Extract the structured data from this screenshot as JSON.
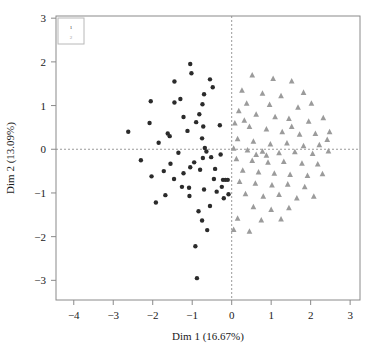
{
  "chart_data": {
    "type": "scatter",
    "title": "",
    "xlabel": "Dim 1 (16.67%)",
    "ylabel": "Dim 2 (13.09%)",
    "xlim": [
      -4.45,
      3.25
    ],
    "ylim": [
      -3.45,
      3.05
    ],
    "xticks": [
      -4,
      -3,
      -2,
      -1,
      0,
      1,
      2,
      3
    ],
    "xticklabels": [
      "−4",
      "−3",
      "−2",
      "−1",
      "0",
      "1",
      "2",
      "3"
    ],
    "yticks": [
      -3,
      -2,
      -1,
      0,
      1,
      2,
      3
    ],
    "yticklabels": [
      "−3",
      "−2",
      "−1",
      "0",
      "1",
      "2",
      "3"
    ],
    "grid": false,
    "reference_lines": {
      "horizontal": 0,
      "vertical": 0,
      "style": "dashed",
      "color": "#9a9a9a"
    },
    "legend": {
      "position": "top-left-inside",
      "entries": [
        {
          "label": "1",
          "marker": "circle",
          "color": "#2b2b2b"
        },
        {
          "label": "2",
          "marker": "triangle",
          "color": "#9b9b9b"
        }
      ]
    },
    "series": [
      {
        "name": "1",
        "marker": "circle",
        "color": "#2b2b2b",
        "points": [
          [
            -1.02,
            1.74
          ],
          [
            -0.55,
            1.6
          ],
          [
            -1.45,
            1.55
          ],
          [
            -0.7,
            1.26
          ],
          [
            -0.74,
            1.03
          ],
          [
            -1.45,
            1.07
          ],
          [
            -0.82,
            0.8
          ],
          [
            -1.22,
            0.74
          ],
          [
            -0.72,
            0.52
          ],
          [
            -1.12,
            0.42
          ],
          [
            -2.62,
            0.4
          ],
          [
            -1.62,
            0.36
          ],
          [
            -1.57,
            0.3
          ],
          [
            -0.75,
            0.25
          ],
          [
            -0.68,
            0.03
          ],
          [
            -0.64,
            -0.05
          ],
          [
            -0.73,
            -0.2
          ],
          [
            -0.52,
            -0.18
          ],
          [
            -0.28,
            -0.12
          ],
          [
            -0.95,
            -0.3
          ],
          [
            -1.55,
            -0.33
          ],
          [
            -0.8,
            -0.47
          ],
          [
            -1.05,
            -0.41
          ],
          [
            -0.42,
            -0.45
          ],
          [
            -1.72,
            -0.5
          ],
          [
            -1.22,
            -0.55
          ],
          [
            -2.03,
            -0.62
          ],
          [
            -1.46,
            -0.68
          ],
          [
            -0.45,
            -0.68
          ],
          [
            -0.22,
            -0.7
          ],
          [
            -0.16,
            -0.7
          ],
          [
            -0.1,
            -0.7
          ],
          [
            -1.26,
            -0.86
          ],
          [
            -1.08,
            -0.88
          ],
          [
            -0.7,
            -0.92
          ],
          [
            -0.38,
            -0.97
          ],
          [
            -0.25,
            -0.86
          ],
          [
            -1.07,
            -1.07
          ],
          [
            -0.2,
            -1.12
          ],
          [
            -0.08,
            -1.03
          ],
          [
            -1.92,
            -1.22
          ],
          [
            -0.84,
            -1.42
          ],
          [
            -0.75,
            -1.63
          ],
          [
            -0.62,
            -1.85
          ],
          [
            -0.92,
            -2.22
          ],
          [
            -0.88,
            -2.95
          ],
          [
            -1.35,
            -0.08
          ],
          [
            -0.9,
            0.62
          ],
          [
            -1.3,
            1.15
          ],
          [
            -2.08,
            0.6
          ],
          [
            -1.85,
            0.15
          ],
          [
            -2.3,
            -0.25
          ],
          [
            -1.68,
            -1.05
          ],
          [
            -0.55,
            -1.3
          ],
          [
            -0.3,
            0.55
          ],
          [
            -0.48,
            1.42
          ],
          [
            -1.05,
            1.95
          ],
          [
            -2.05,
            1.1
          ]
        ]
      },
      {
        "name": "2",
        "marker": "triangle",
        "color": "#9b9b9b",
        "points": [
          [
            0.52,
            1.7
          ],
          [
            1.05,
            1.62
          ],
          [
            1.52,
            1.56
          ],
          [
            0.26,
            1.35
          ],
          [
            0.78,
            1.28
          ],
          [
            1.25,
            1.22
          ],
          [
            1.82,
            1.3
          ],
          [
            0.38,
            1.05
          ],
          [
            0.96,
            1.02
          ],
          [
            1.68,
            0.96
          ],
          [
            2.02,
            1.05
          ],
          [
            0.18,
            0.88
          ],
          [
            0.62,
            0.8
          ],
          [
            1.1,
            0.74
          ],
          [
            1.45,
            0.7
          ],
          [
            1.95,
            0.64
          ],
          [
            2.32,
            0.72
          ],
          [
            0.08,
            0.6
          ],
          [
            0.45,
            0.52
          ],
          [
            0.88,
            0.46
          ],
          [
            1.28,
            0.4
          ],
          [
            1.72,
            0.34
          ],
          [
            2.12,
            0.36
          ],
          [
            2.48,
            0.4
          ],
          [
            0.15,
            0.24
          ],
          [
            0.55,
            0.18
          ],
          [
            0.98,
            0.12
          ],
          [
            1.4,
            0.14
          ],
          [
            1.82,
            0.08
          ],
          [
            2.22,
            0.1
          ],
          [
            0.05,
            0.02
          ],
          [
            0.4,
            -0.02
          ],
          [
            0.78,
            -0.05
          ],
          [
            1.2,
            -0.08
          ],
          [
            1.6,
            -0.06
          ],
          [
            2.05,
            -0.1
          ],
          [
            2.45,
            -0.04
          ],
          [
            0.12,
            -0.22
          ],
          [
            0.52,
            -0.26
          ],
          [
            0.92,
            -0.3
          ],
          [
            1.32,
            -0.28
          ],
          [
            1.78,
            -0.32
          ],
          [
            2.18,
            -0.34
          ],
          [
            0.28,
            -0.48
          ],
          [
            0.68,
            -0.52
          ],
          [
            1.08,
            -0.55
          ],
          [
            1.48,
            -0.58
          ],
          [
            1.92,
            -0.6
          ],
          [
            2.3,
            -0.56
          ],
          [
            0.2,
            -0.74
          ],
          [
            0.6,
            -0.78
          ],
          [
            1.02,
            -0.82
          ],
          [
            1.42,
            -0.8
          ],
          [
            1.85,
            -0.86
          ],
          [
            0.35,
            -1.02
          ],
          [
            0.8,
            -1.08
          ],
          [
            1.2,
            -1.04
          ],
          [
            1.65,
            -1.12
          ],
          [
            2.08,
            -1.08
          ],
          [
            0.55,
            -1.32
          ],
          [
            1.0,
            -1.38
          ],
          [
            1.45,
            -1.34
          ],
          [
            0.15,
            -1.58
          ],
          [
            0.75,
            -1.62
          ],
          [
            1.25,
            -1.6
          ],
          [
            0.05,
            -1.84
          ],
          [
            0.45,
            -1.88
          ],
          [
            0.62,
            -0.12
          ],
          [
            1.52,
            0.52
          ],
          [
            0.32,
            0.66
          ],
          [
            2.42,
            0.22
          ],
          [
            0.88,
            -0.14
          ]
        ]
      }
    ]
  }
}
